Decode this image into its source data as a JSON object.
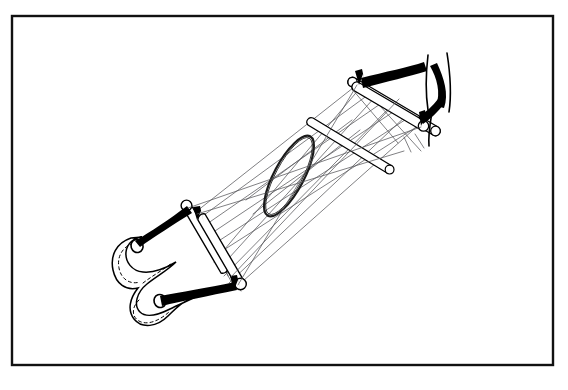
{
  "figure": {
    "title": "Technical line drawing of a string-and-rod sling apparatus",
    "medium": "black ink line art on white ground",
    "background_color": "#ffffff",
    "ink_color": "#000000",
    "string_color": "#55555a",
    "frame": {
      "label": "illustration border",
      "stroke_color": "#111111",
      "stroke_width": 2.4,
      "x": 12,
      "y": 16,
      "width": 541,
      "height": 349
    },
    "parts": [
      {
        "name": "lower-rod",
        "label": "lower cross rod",
        "style": "outlined cylinder with rounded ends"
      },
      {
        "name": "upper-rod",
        "label": "upper cross rod",
        "style": "outlined cylinder with rounded ends"
      },
      {
        "name": "center-hoop",
        "label": "central oval hoop",
        "style": "tapered ellipse ring"
      },
      {
        "name": "crossed-rod-a",
        "label": "crossing rod, upper",
        "style": "outlined cylinder"
      },
      {
        "name": "crossed-rod-b",
        "label": "crossing rod, lower",
        "style": "outlined cylinder"
      },
      {
        "name": "leather-sling",
        "label": "stitched leather sling",
        "style": "solid outline with dashed stitch seam and two eyelets"
      },
      {
        "name": "vertical-post",
        "label": "vertical post",
        "style": "two parallel contour lines"
      },
      {
        "name": "lashing-straps",
        "label": "heavy black lashing straps",
        "style": "solid black tapered bands"
      },
      {
        "name": "string-web",
        "label": "converging string web",
        "style": "many thin straight lines"
      }
    ],
    "counts": {
      "rods": 4,
      "hoops": 1,
      "eyelets": 2,
      "strings": 22
    }
  }
}
